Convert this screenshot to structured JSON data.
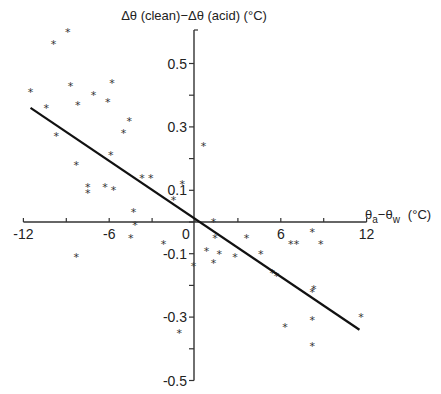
{
  "chart_data": {
    "type": "scatter",
    "title": "",
    "xlabel": "θa−θw (°C)",
    "xlabel_parts": {
      "base1": "θ",
      "sub1": "a",
      "mid": "−θ",
      "sub2": "w",
      "unit": "(°C)"
    },
    "ylabel": "Δθ (clean)−Δθ (acid) (°C)",
    "xlim": [
      -12,
      12
    ],
    "ylim": [
      -0.5,
      0.6
    ],
    "x_ticks": [
      -12,
      -9,
      -6,
      -3,
      0,
      3,
      6,
      9,
      12
    ],
    "x_tick_labels": [
      "-12",
      "-6",
      "0",
      "6",
      "12"
    ],
    "x_tick_label_values": [
      -12,
      -6,
      0,
      6,
      12
    ],
    "y_ticks": [
      -0.5,
      -0.4,
      -0.3,
      -0.2,
      -0.1,
      0,
      0.1,
      0.2,
      0.3,
      0.4,
      0.5
    ],
    "y_tick_labels": [
      "0.5",
      "0.3",
      "0.1",
      "-0.1",
      "-0.3",
      "-0.5"
    ],
    "y_tick_label_values": [
      0.5,
      0.3,
      0.1,
      -0.1,
      -0.3,
      -0.5
    ],
    "grid": false,
    "legend": null,
    "marker": "*",
    "series": [
      {
        "name": "observations",
        "points": [
          [
            -11.5,
            0.41
          ],
          [
            -9.9,
            0.56
          ],
          [
            -8.9,
            0.6
          ],
          [
            -10.4,
            0.36
          ],
          [
            -8.7,
            0.43
          ],
          [
            -9.7,
            0.27
          ],
          [
            -8.2,
            0.37
          ],
          [
            -7.1,
            0.4
          ],
          [
            -5.8,
            0.44
          ],
          [
            -6.1,
            0.38
          ],
          [
            -4.6,
            0.32
          ],
          [
            -5.0,
            0.28
          ],
          [
            -5.9,
            0.21
          ],
          [
            -8.3,
            0.18
          ],
          [
            -3.7,
            0.14
          ],
          [
            -3.1,
            0.14
          ],
          [
            -7.5,
            0.11
          ],
          [
            -7.5,
            0.09
          ],
          [
            -6.3,
            0.11
          ],
          [
            -5.7,
            0.1
          ],
          [
            -0.9,
            0.12
          ],
          [
            -1.5,
            0.07
          ],
          [
            0.6,
            0.24
          ],
          [
            -4.3,
            0.03
          ],
          [
            -4.2,
            -0.01
          ],
          [
            -4.5,
            -0.05
          ],
          [
            -8.3,
            -0.11
          ],
          [
            -2.2,
            -0.07
          ],
          [
            -1.1,
            -0.35
          ],
          [
            -0.1,
            -0.14
          ],
          [
            1.3,
            0.0
          ],
          [
            1.4,
            -0.05
          ],
          [
            0.8,
            -0.09
          ],
          [
            1.7,
            -0.1
          ],
          [
            1.3,
            -0.13
          ],
          [
            2.8,
            -0.11
          ],
          [
            3.6,
            -0.05
          ],
          [
            4.6,
            -0.1
          ],
          [
            5.4,
            -0.16
          ],
          [
            5.7,
            -0.17
          ],
          [
            6.7,
            -0.07
          ],
          [
            7.1,
            -0.07
          ],
          [
            8.2,
            -0.03
          ],
          [
            8.8,
            -0.07
          ],
          [
            8.3,
            -0.21
          ],
          [
            8.2,
            -0.22
          ],
          [
            8.2,
            -0.31
          ],
          [
            6.3,
            -0.33
          ],
          [
            8.2,
            -0.39
          ],
          [
            11.6,
            -0.3
          ]
        ]
      }
    ],
    "regression_line": {
      "x": [
        -11.5,
        11.5
      ],
      "y": [
        0.36,
        -0.34
      ],
      "slope": -0.0304,
      "intercept": 0.01
    }
  }
}
